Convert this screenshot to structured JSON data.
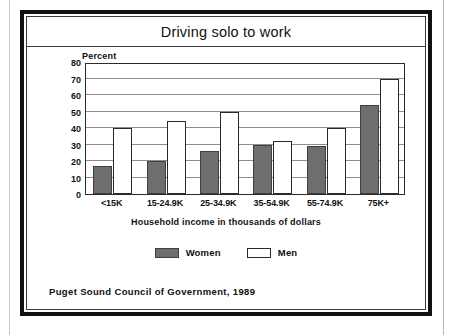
{
  "figure": {
    "title": "Driving solo to work",
    "source_note": "Puget Sound Council of Government, 1989"
  },
  "chart_data": {
    "type": "bar",
    "title": "Driving solo to work",
    "subtitle": "",
    "xlabel": "Household income in thousands of dollars",
    "ylabel": "Percent",
    "ylim": [
      0,
      80
    ],
    "yticks": [
      0,
      10,
      20,
      30,
      40,
      50,
      60,
      70,
      80
    ],
    "ytick_labels": [
      "0",
      "10",
      "20",
      "30",
      "40",
      "50",
      "60",
      "70",
      "80"
    ],
    "grid": true,
    "legend_position": "bottom",
    "categories": [
      "<15K",
      "15-24.9K",
      "25-34.9K",
      "35-54.9K",
      "55-74.9K",
      "75K+"
    ],
    "series": [
      {
        "name": "Women",
        "color": "#6e6e6e",
        "values": [
          17,
          20,
          26,
          30,
          29,
          54
        ]
      },
      {
        "name": "Men",
        "color": "#ffffff",
        "values": [
          40,
          44,
          50,
          32,
          40,
          70
        ]
      }
    ],
    "annotations": [
      "Percent"
    ]
  },
  "legend": {
    "items": [
      {
        "label": "Women",
        "swatch": "filled-gray-swatch"
      },
      {
        "label": "Men",
        "swatch": "outlined-white-swatch"
      }
    ]
  }
}
